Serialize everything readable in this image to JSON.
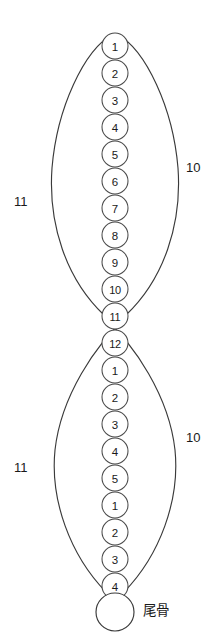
{
  "diagram": {
    "background_color": "#ffffff",
    "stroke_color": "#3a3a3a",
    "circle_fill": "#ffffff",
    "upper_lobe": {
      "left_label": "11",
      "right_label": "10"
    },
    "lower_lobe": {
      "left_label": "11",
      "right_label": "10"
    },
    "coccyx": {
      "label": "尾骨"
    },
    "vertebrae": [
      {
        "num": "1",
        "cx": 115,
        "cy": 46,
        "r": 13
      },
      {
        "num": "2",
        "cx": 115,
        "cy": 73,
        "r": 13
      },
      {
        "num": "3",
        "cx": 115,
        "cy": 100,
        "r": 13
      },
      {
        "num": "4",
        "cx": 115,
        "cy": 127,
        "r": 13
      },
      {
        "num": "5",
        "cx": 115,
        "cy": 154,
        "r": 13
      },
      {
        "num": "6",
        "cx": 115,
        "cy": 181,
        "r": 13
      },
      {
        "num": "7",
        "cx": 115,
        "cy": 208,
        "r": 13
      },
      {
        "num": "8",
        "cx": 115,
        "cy": 235,
        "r": 13
      },
      {
        "num": "9",
        "cx": 115,
        "cy": 262,
        "r": 13
      },
      {
        "num": "10",
        "cx": 115,
        "cy": 289,
        "r": 13
      },
      {
        "num": "11",
        "cx": 115,
        "cy": 316,
        "r": 13
      },
      {
        "num": "12",
        "cx": 115,
        "cy": 343,
        "r": 13
      },
      {
        "num": "1",
        "cx": 115,
        "cy": 370,
        "r": 13
      },
      {
        "num": "2",
        "cx": 115,
        "cy": 397,
        "r": 13
      },
      {
        "num": "3",
        "cx": 115,
        "cy": 424,
        "r": 13
      },
      {
        "num": "4",
        "cx": 115,
        "cy": 451,
        "r": 13
      },
      {
        "num": "5",
        "cx": 115,
        "cy": 478,
        "r": 13
      },
      {
        "num": "1",
        "cx": 115,
        "cy": 505,
        "r": 13
      },
      {
        "num": "2",
        "cx": 115,
        "cy": 532,
        "r": 13
      },
      {
        "num": "3",
        "cx": 115,
        "cy": 559,
        "r": 13
      },
      {
        "num": "4",
        "cx": 115,
        "cy": 586,
        "r": 13
      }
    ],
    "coccyx_circle": {
      "cx": 115,
      "cy": 612,
      "r": 19
    }
  }
}
